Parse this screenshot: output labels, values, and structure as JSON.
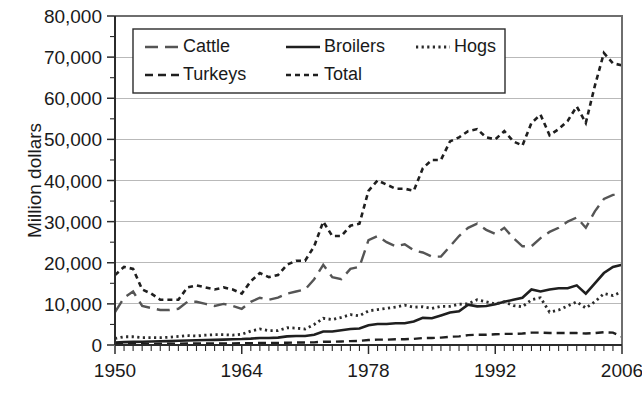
{
  "figure": {
    "width": 642,
    "height": 397,
    "background": "#ffffff"
  },
  "chart_data": {
    "type": "line",
    "title": "",
    "xlabel": "",
    "ylabel": "Million dollars",
    "xlim": [
      1950,
      2006
    ],
    "ylim": [
      0,
      80000
    ],
    "grid": true,
    "grid_axis": "y",
    "legend_position": "top-left-inside",
    "x_ticks_major": [
      1950,
      1964,
      1978,
      1992,
      2006
    ],
    "x_tick_labels": [
      "1950",
      "1964",
      "1978",
      "1992",
      "2006"
    ],
    "x_minor_tick_interval": 1,
    "y_ticks": [
      0,
      10000,
      20000,
      30000,
      40000,
      50000,
      60000,
      70000,
      80000
    ],
    "y_tick_labels": [
      "0",
      "10,000",
      "20,000",
      "30,000",
      "40,000",
      "50,000",
      "60,000",
      "70,000",
      "80,000"
    ],
    "y_minor_tick_interval": 5000,
    "x": [
      1950,
      1951,
      1952,
      1953,
      1954,
      1955,
      1956,
      1957,
      1958,
      1959,
      1960,
      1961,
      1962,
      1963,
      1964,
      1965,
      1966,
      1967,
      1968,
      1969,
      1970,
      1971,
      1972,
      1973,
      1974,
      1975,
      1976,
      1977,
      1978,
      1979,
      1980,
      1981,
      1982,
      1983,
      1984,
      1985,
      1986,
      1987,
      1988,
      1989,
      1990,
      1991,
      1992,
      1993,
      1994,
      1995,
      1996,
      1997,
      1998,
      1999,
      2000,
      2001,
      2002,
      2003,
      2004,
      2005,
      2006
    ],
    "series": [
      {
        "name": "Cattle",
        "style": "long-dash",
        "color": "#555555",
        "values": [
          8000,
          11500,
          13000,
          9500,
          9000,
          8500,
          8500,
          8800,
          10500,
          10500,
          10000,
          9500,
          10000,
          9500,
          8800,
          10500,
          11500,
          11000,
          11500,
          12500,
          13000,
          13500,
          16000,
          19500,
          16500,
          16000,
          18500,
          19000,
          25500,
          26500,
          25000,
          24000,
          24500,
          23000,
          22500,
          21500,
          21500,
          24000,
          26500,
          28500,
          29500,
          28000,
          27000,
          28500,
          26000,
          24000,
          24000,
          26000,
          27500,
          28500,
          30000,
          31000,
          28500,
          32500,
          35500,
          36500,
          36500
        ]
      },
      {
        "name": "Broilers",
        "style": "solid",
        "color": "#1f1f1f",
        "values": [
          600,
          700,
          750,
          800,
          850,
          900,
          950,
          1050,
          1100,
          1150,
          1200,
          1250,
          1300,
          1400,
          1450,
          1550,
          1700,
          1700,
          1800,
          2100,
          2200,
          2200,
          2500,
          3300,
          3300,
          3600,
          3900,
          4000,
          4800,
          5100,
          5100,
          5300,
          5300,
          5700,
          6600,
          6500,
          7200,
          7900,
          8200,
          9800,
          9400,
          9500,
          9900,
          10500,
          11000,
          11500,
          13500,
          13000,
          13500,
          13800,
          13800,
          14500,
          12500,
          15000,
          17500,
          19000,
          19500
        ]
      },
      {
        "name": "Hogs",
        "style": "dotted",
        "color": "#2b2b2b",
        "values": [
          1600,
          2000,
          2000,
          1800,
          1800,
          1800,
          1900,
          2100,
          2300,
          2200,
          2400,
          2500,
          2500,
          2400,
          2600,
          3400,
          3900,
          3500,
          3500,
          4200,
          4100,
          3900,
          5000,
          6500,
          6200,
          6700,
          7400,
          7100,
          8300,
          8600,
          8900,
          9200,
          9700,
          9200,
          9300,
          8900,
          9400,
          9400,
          9900,
          10000,
          11000,
          10500,
          10000,
          10500,
          9600,
          9300,
          11000,
          11500,
          8000,
          8500,
          9500,
          10500,
          9000,
          10500,
          12500,
          12000,
          13000
        ]
      },
      {
        "name": "Turkeys",
        "style": "medium-dash",
        "color": "#1f1f1f",
        "values": [
          200,
          250,
          250,
          250,
          250,
          300,
          300,
          300,
          350,
          350,
          350,
          380,
          400,
          400,
          420,
          450,
          500,
          480,
          500,
          550,
          600,
          600,
          650,
          800,
          800,
          850,
          950,
          1000,
          1200,
          1300,
          1300,
          1400,
          1400,
          1500,
          1700,
          1700,
          1800,
          2000,
          2100,
          2400,
          2500,
          2500,
          2600,
          2700,
          2700,
          2800,
          3000,
          3000,
          2900,
          2900,
          2900,
          2900,
          2800,
          2900,
          3100,
          3000,
          2000
        ]
      },
      {
        "name": "Total",
        "style": "short-dash",
        "color": "#1f1f1f",
        "values": [
          17000,
          19000,
          18500,
          13500,
          12500,
          11000,
          11000,
          11000,
          14000,
          14500,
          14000,
          13500,
          14000,
          13500,
          12500,
          15500,
          17500,
          16500,
          17000,
          19500,
          20500,
          20500,
          24000,
          30000,
          26500,
          26500,
          29000,
          29500,
          37500,
          40000,
          39000,
          38000,
          38000,
          37500,
          43000,
          45000,
          45000,
          49500,
          50500,
          52000,
          52500,
          50500,
          50000,
          52000,
          49500,
          48500,
          54000,
          56000,
          51000,
          52500,
          54500,
          58000,
          54000,
          63000,
          71000,
          68500,
          68000
        ]
      }
    ]
  },
  "axes": {
    "y_axis_title": "Million dollars"
  },
  "legend": {
    "entries": [
      {
        "label": "Cattle",
        "style": "long-dash"
      },
      {
        "label": "Broilers",
        "style": "solid"
      },
      {
        "label": "Hogs",
        "style": "dotted"
      },
      {
        "label": "Turkeys",
        "style": "medium-dash"
      },
      {
        "label": "Total",
        "style": "short-dash"
      }
    ]
  }
}
